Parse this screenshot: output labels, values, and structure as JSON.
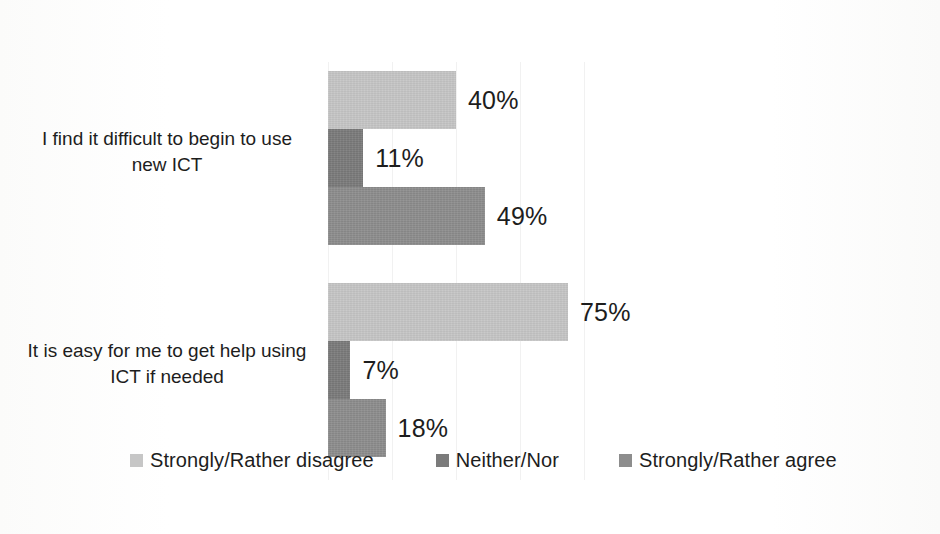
{
  "chart_data": {
    "type": "bar",
    "orientation": "horizontal",
    "title": "",
    "subtitle": "",
    "xlabel": "",
    "ylabel": "",
    "categories": [
      "I find it difficult to begin to use new ICT",
      "It is easy for me to get help using ICT if needed"
    ],
    "series": [
      {
        "name": "Strongly/Rather disagree",
        "color": "#c6c6c6",
        "values": [
          40,
          75
        ],
        "labels": [
          "40%",
          "75%"
        ]
      },
      {
        "name": "Neither/Nor",
        "color": "#7b7b7b",
        "values": [
          11,
          7
        ],
        "labels": [
          "11%",
          "7%"
        ]
      },
      {
        "name": "Strongly/Rather agree",
        "color": "#8d8d8d",
        "values": [
          49,
          18
        ],
        "labels": [
          "49%",
          "18%"
        ]
      }
    ],
    "value_unit": "%",
    "xlim": [
      0,
      80
    ],
    "gridlines": [
      0,
      20,
      40,
      60,
      80
    ],
    "grid": true,
    "legend_position": "bottom",
    "data_labels": true
  },
  "legend": {
    "items": [
      {
        "label": "Strongly/Rather disagree",
        "color": "#c6c6c6"
      },
      {
        "label": "Neither/Nor",
        "color": "#7b7b7b"
      },
      {
        "label": "Strongly/Rather agree",
        "color": "#8d8d8d"
      }
    ]
  },
  "axis": {
    "category_labels": [
      "I find it difficult to begin to use new ICT",
      "It is easy for me to get help using ICT if needed"
    ]
  },
  "bars": {
    "group_0": [
      {
        "series": "Strongly/Rather disagree",
        "label": "40%",
        "value": 40
      },
      {
        "series": "Neither/Nor",
        "label": "11%",
        "value": 11
      },
      {
        "series": "Strongly/Rather agree",
        "label": "49%",
        "value": 49
      }
    ],
    "group_1": [
      {
        "series": "Strongly/Rather disagree",
        "label": "75%",
        "value": 75
      },
      {
        "series": "Neither/Nor",
        "label": "7%",
        "value": 7
      },
      {
        "series": "Strongly/Rather agree",
        "label": "18%",
        "value": 18
      }
    ]
  }
}
